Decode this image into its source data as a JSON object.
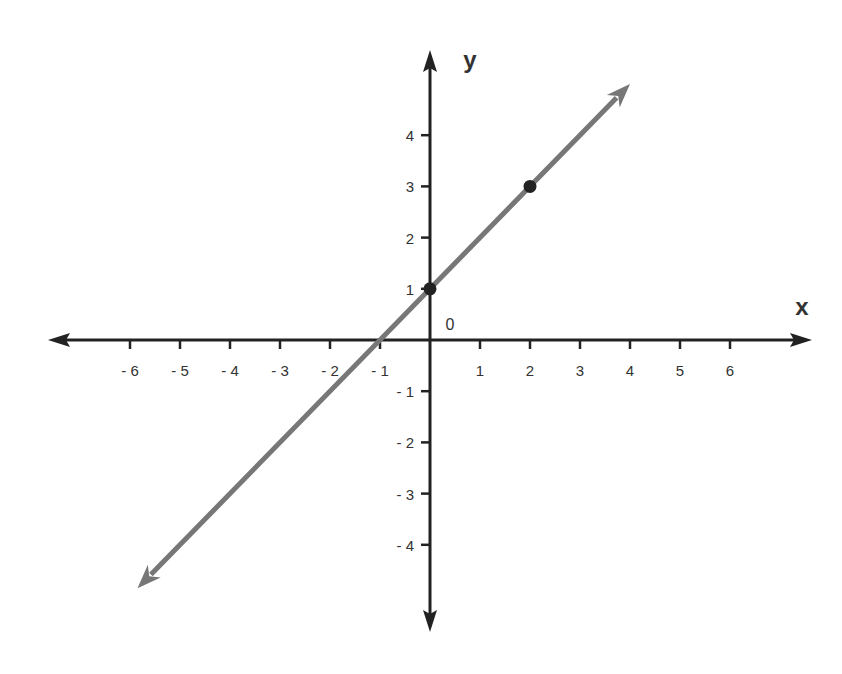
{
  "chart_data": {
    "type": "line",
    "title": "",
    "xlabel": "x",
    "ylabel": "y",
    "origin_label": "0",
    "xlim": [
      -7,
      7
    ],
    "ylim": [
      -5,
      5
    ],
    "x_ticks": [
      -6,
      -5,
      -4,
      -3,
      -2,
      -1,
      1,
      2,
      3,
      4,
      5,
      6
    ],
    "x_tick_labels": [
      "- 6",
      "- 5",
      "- 4",
      "- 3",
      "- 2",
      "- 1",
      "1",
      "2",
      "3",
      "4",
      "5",
      "6"
    ],
    "y_ticks": [
      4,
      3,
      2,
      1,
      -1,
      -2,
      -3,
      -4
    ],
    "y_tick_labels": [
      "4",
      "3",
      "2",
      "1",
      "- 1",
      "- 2",
      "- 3",
      "- 4"
    ],
    "grid": false,
    "series": [
      {
        "name": "line",
        "equation": "y = x + 1",
        "slope": 1,
        "intercept": 1,
        "color": "#777777",
        "marked_points": [
          {
            "x": 0,
            "y": 1
          },
          {
            "x": 2,
            "y": 3
          }
        ],
        "extends_both_directions": true
      }
    ],
    "axis_color": "#222222"
  }
}
